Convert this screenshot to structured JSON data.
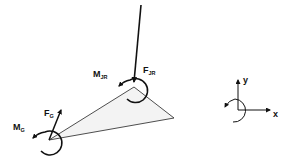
{
  "diagram": {
    "type": "free-body-diagram",
    "segment": {
      "shape": "triangle",
      "vertices": {
        "proximal_joint": [
          134,
          87
        ],
        "distal_point": [
          174,
          118
        ],
        "com": [
          49,
          140
        ]
      },
      "fill": "#f2f2f2",
      "stroke": "#222222"
    },
    "forces": [
      {
        "id": "F_JR",
        "label_main": "F",
        "label_sub": "JR",
        "from": [
          141,
          4
        ],
        "to": [
          134,
          84
        ]
      },
      {
        "id": "F_G",
        "label_main": "F",
        "label_sub": "G",
        "from": [
          49,
          140
        ],
        "to": [
          62,
          108
        ]
      }
    ],
    "moments": [
      {
        "id": "M_JR",
        "label_main": "M",
        "label_sub": "JR",
        "center": [
          137,
          88
        ],
        "direction": "counterclockwise"
      },
      {
        "id": "M_G",
        "label_main": "M",
        "label_sub": "G",
        "center": [
          49,
          140
        ],
        "direction": "counterclockwise"
      }
    ],
    "coordinate_frame": {
      "origin": [
        238,
        110
      ],
      "x_label": "x",
      "y_label": "y",
      "rotation_label": "counterclockwise positive"
    }
  },
  "labels": {
    "m_jr_main": "M",
    "m_jr_sub": "JR",
    "f_jr_main": "F",
    "f_jr_sub": "JR",
    "f_g_main": "F",
    "f_g_sub": "G",
    "m_g_main": "M",
    "m_g_sub": "G",
    "axis_x": "x",
    "axis_y": "y"
  }
}
